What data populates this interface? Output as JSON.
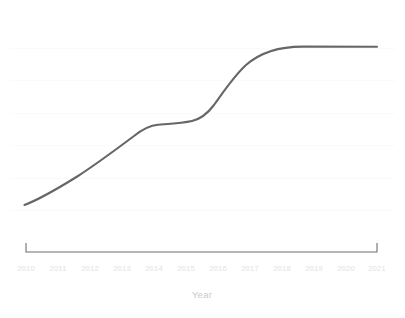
{
  "chart_data": {
    "type": "line",
    "title": "",
    "subtitle": "",
    "xlabel": "Year",
    "ylabel": "",
    "categories": [
      "2010",
      "2011",
      "2012",
      "2013",
      "2014",
      "2015",
      "2016",
      "2017",
      "2018",
      "2019",
      "2020",
      "2021"
    ],
    "x": [
      2010,
      2011,
      2012,
      2013,
      2014,
      2015,
      2016,
      2017,
      2018,
      2019,
      2020,
      2021
    ],
    "series": [
      {
        "name": "value",
        "values": [
          8,
          17,
          27,
          38,
          50,
          52,
          56,
          74,
          90,
          100,
          100,
          100
        ]
      }
    ],
    "xlim": [
      2010,
      2021
    ],
    "ylim": [
      0,
      110
    ],
    "grid": true,
    "grid_axis": "y",
    "legend": false,
    "legend_position": "none",
    "annotations": [],
    "y_tick_labels": [],
    "line_color": "#666666",
    "grid_color": "#fafafa",
    "axis_color": "#6e6e6e",
    "tick_label_color": "#e2e2e2",
    "axis_title_color": "#c9c9c9"
  },
  "axis": {
    "x_title": "Year",
    "ticks": [
      {
        "label": "2010",
        "px": 26
      },
      {
        "label": "2011",
        "px": 58
      },
      {
        "label": "2012",
        "px": 90
      },
      {
        "label": "2013",
        "px": 122
      },
      {
        "label": "2014",
        "px": 154
      },
      {
        "label": "2015",
        "px": 186
      },
      {
        "label": "2016",
        "px": 218
      },
      {
        "label": "2017",
        "px": 250
      },
      {
        "label": "2018",
        "px": 282
      },
      {
        "label": "2019",
        "px": 314
      },
      {
        "label": "2020",
        "px": 346
      },
      {
        "label": "2021",
        "px": 377
      }
    ]
  },
  "geometry": {
    "axis_path": "M 26 243 L 26 252 L 377 252 L 377 243",
    "series_path": "M 24.5 205 C 40 199 62 186 78 176 C 98 163 118 148 134 136 C 144 128 150 125.5 158 124.8 C 170 123.8 182 123.2 192 121 C 202 118.6 208 113 214 105 C 224 91 234 76 246 65 C 262 51 282 46.5 303 46.6 L 377 46.8",
    "gridlines_y": [
      48,
      80,
      113,
      145,
      178,
      210
    ]
  }
}
